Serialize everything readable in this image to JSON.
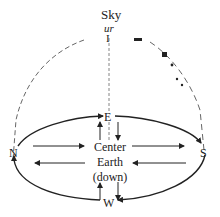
{
  "diagram": {
    "labels": {
      "sky": "Sky",
      "sky_sub": "ur",
      "zenith_mark": "I",
      "east": "E",
      "west": "W",
      "north": "N",
      "south": "S",
      "center": "Center",
      "earth": "Earth",
      "down": "(down)"
    },
    "colors": {
      "ink": "#222222",
      "dashed": "#555555",
      "background": "#ffffff"
    }
  }
}
